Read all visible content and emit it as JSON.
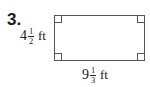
{
  "problem": {
    "number": "3.",
    "figure": "rectangle",
    "side_labels": {
      "height": {
        "whole": "4",
        "numerator": "1",
        "denominator": "2",
        "unit": "ft"
      },
      "width": {
        "whole": "9",
        "numerator": "1",
        "denominator": "3",
        "unit": "ft"
      }
    },
    "right_angle_marks": 4
  }
}
